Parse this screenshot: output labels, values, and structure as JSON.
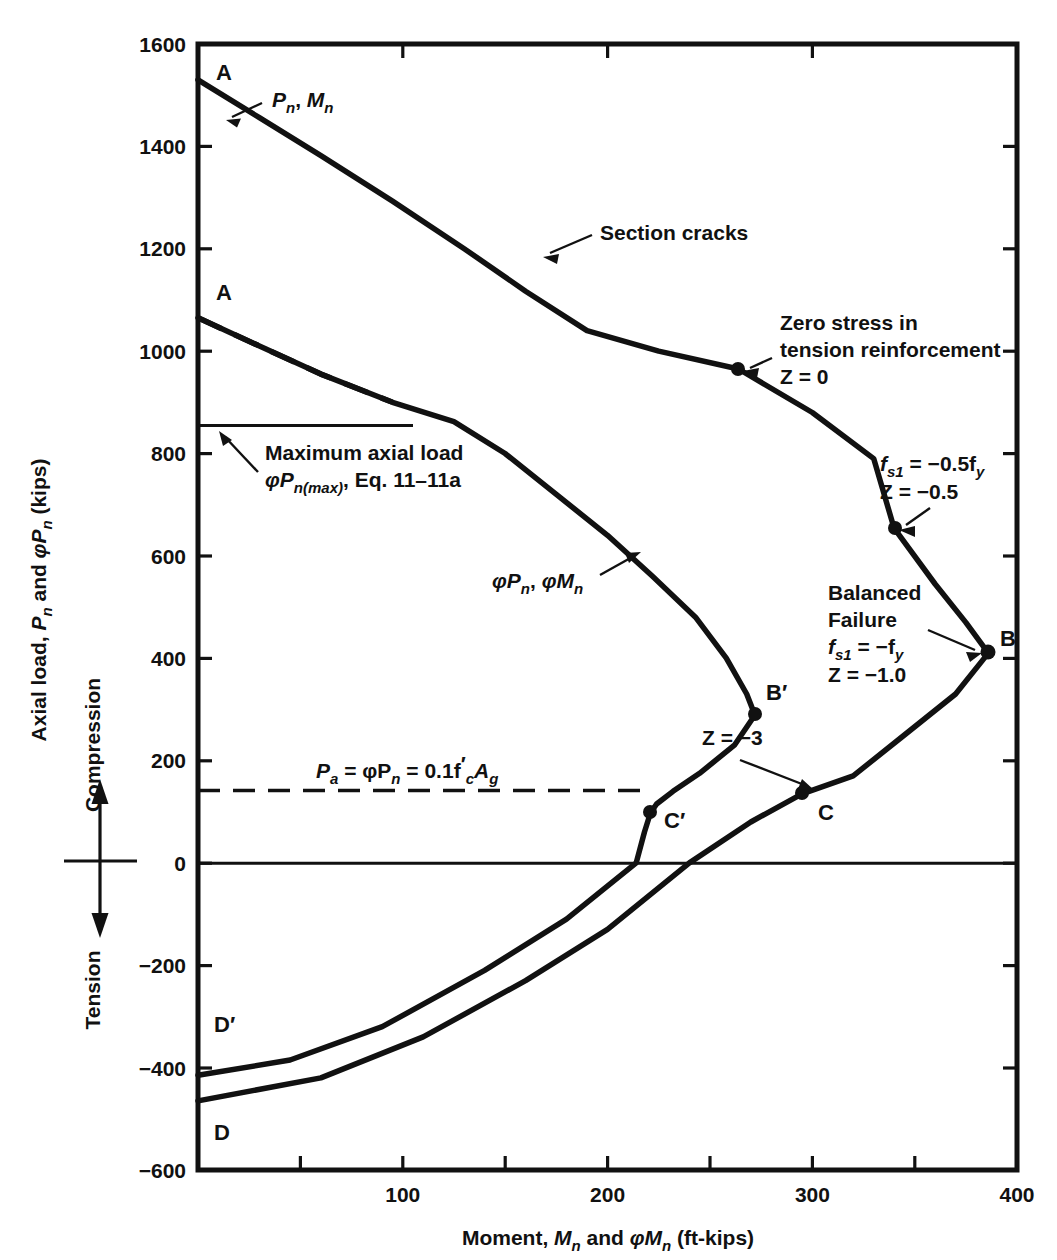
{
  "chart_data": {
    "type": "line",
    "title": "",
    "xlabel": "Moment, Mn and φMn (ft-kips)",
    "ylabel": "Axial load, Pn and φPn (kips)",
    "xlim": [
      0,
      400
    ],
    "ylim": [
      -600,
      1600
    ],
    "xticks": [
      100,
      200,
      300,
      400
    ],
    "xticklabels": [
      "100",
      "200",
      "300",
      "400"
    ],
    "xminorticks": [
      50,
      150,
      250,
      350
    ],
    "yticks": [
      1600,
      1400,
      1200,
      1000,
      800,
      600,
      400,
      200,
      0,
      -200,
      -400,
      -600
    ],
    "yticklabels": [
      "1600",
      "1400",
      "1200",
      "1000",
      "800",
      "600",
      "400",
      "200",
      "0",
      "−200",
      "−400",
      "−600"
    ],
    "grid": false,
    "legend": "none",
    "series": [
      {
        "name": "Pn, Mn (nominal strength interaction curve)",
        "style": "solid",
        "points": [
          [
            0,
            1530
          ],
          [
            30,
            1456
          ],
          [
            60,
            1382
          ],
          [
            95,
            1293
          ],
          [
            130,
            1200
          ],
          [
            160,
            1117
          ],
          [
            190,
            1040
          ],
          [
            225,
            1000
          ],
          [
            264,
            965
          ],
          [
            300,
            880
          ],
          [
            330,
            790
          ],
          [
            340,
            654
          ],
          [
            360,
            545
          ],
          [
            375,
            470
          ],
          [
            386,
            410
          ],
          [
            370,
            330
          ],
          [
            345,
            250
          ],
          [
            320,
            170
          ],
          [
            295,
            135
          ],
          [
            270,
            80
          ],
          [
            240,
            0
          ],
          [
            200,
            -130
          ],
          [
            160,
            -230
          ],
          [
            110,
            -340
          ],
          [
            60,
            -420
          ],
          [
            0,
            -465
          ]
        ]
      },
      {
        "name": "φPn, φMn (design strength interaction curve)",
        "style": "solid",
        "points": [
          [
            0,
            1065
          ],
          [
            30,
            1010
          ],
          [
            60,
            955
          ],
          [
            95,
            900
          ],
          [
            125,
            862
          ],
          [
            150,
            800
          ],
          [
            175,
            720
          ],
          [
            200,
            640
          ],
          [
            222,
            560
          ],
          [
            243,
            480
          ],
          [
            258,
            400
          ],
          [
            268,
            330
          ],
          [
            272,
            289
          ],
          [
            262,
            230
          ],
          [
            245,
            175
          ],
          [
            232,
            140
          ],
          [
            224,
            115
          ],
          [
            221,
            98
          ],
          [
            218,
            60
          ],
          [
            214,
            0
          ],
          [
            180,
            -110
          ],
          [
            140,
            -210
          ],
          [
            90,
            -320
          ],
          [
            45,
            -385
          ],
          [
            0,
            -415
          ]
        ]
      },
      {
        "name": "A to φPn curve dashed segment (cut off by max axial load)",
        "style": "dashed",
        "points": [
          [
            0,
            1065
          ],
          [
            30,
            1010
          ],
          [
            60,
            955
          ],
          [
            95,
            900
          ]
        ]
      },
      {
        "name": "Maximum axial load φPn(max) cutoff",
        "style": "solid-thin-horizontal",
        "points": [
          [
            0,
            855
          ],
          [
            105,
            855
          ]
        ]
      },
      {
        "name": "Pa = φPn = 0.1f'cAg",
        "style": "dashed-thin-horizontal",
        "points": [
          [
            0,
            142
          ],
          [
            222,
            142
          ]
        ]
      },
      {
        "name": "zero axis",
        "style": "solid-thin-horizontal",
        "points": [
          [
            0,
            0
          ],
          [
            400,
            0
          ]
        ]
      }
    ],
    "marked_points": [
      {
        "label": "A",
        "x": 0,
        "y": 1530,
        "series": "Pn, Mn",
        "label_dx": 18,
        "label_dy": 34
      },
      {
        "label": "A",
        "x": 0,
        "y": 1065,
        "series": "φPn, φMn",
        "label_dx": 18,
        "label_dy": -16
      },
      {
        "label": "B",
        "x": 386,
        "y": 410,
        "series": "Pn, Mn",
        "label_dx": 22,
        "label_dy": -10,
        "dot": true
      },
      {
        "label": "B′",
        "x": 272,
        "y": 289,
        "series": "φPn, φMn",
        "label_dx": 20,
        "label_dy": -12,
        "dot": true
      },
      {
        "label": "C",
        "x": 295,
        "y": 135,
        "series": "Pn, Mn",
        "label_dx": 22,
        "label_dy": 24,
        "dot": true
      },
      {
        "label": "C′",
        "x": 221,
        "y": 98,
        "series": "φPn, φMn",
        "label_dx": 20,
        "label_dy": 10,
        "dot": true
      },
      {
        "label": "D",
        "x": 0,
        "y": -465,
        "series": "Pn, Mn",
        "label_dx": 16,
        "label_dy": 32
      },
      {
        "label": "D′",
        "x": 0,
        "y": -415,
        "series": "φPn, φMn",
        "label_dx": 16,
        "label_dy": -14
      },
      {
        "label": "Z = 0",
        "x": 264,
        "y": 965,
        "series": "Pn, Mn",
        "dot": true
      },
      {
        "label": "Z = -0.5",
        "x": 340,
        "y": 654,
        "series": "Pn, Mn",
        "dot": true
      }
    ]
  },
  "axes": {
    "y_title_main": "Axial load, ",
    "y_title_pn": "P",
    "y_title_pn_sub": "n",
    "y_title_and": " and ",
    "y_title_phi": "φP",
    "y_title_phi_sub": "n",
    "y_title_units": " (kips)",
    "y_title_plain": "Axial load, Pn and φPn (kips)",
    "compression_label": "Compression",
    "tension_label": "Tension",
    "x_title_plain": "Moment, Mn and φMn (ft-kips)",
    "x_title_main": "Moment, ",
    "x_title_mn": "M",
    "x_title_mn_sub": "n",
    "x_title_and": " and ",
    "x_title_phi": "φM",
    "x_title_phi_sub": "n",
    "x_title_units": " (ft-kips)",
    "ytick_labels": [
      "1600",
      "1400",
      "1200",
      "1000",
      "800",
      "600",
      "400",
      "200",
      "0",
      "−200",
      "−400",
      "−600"
    ],
    "xtick_labels": [
      "100",
      "200",
      "300",
      "400"
    ]
  },
  "annotations": {
    "pn_mn_curve": {
      "text": "Pn, Mn",
      "parts": [
        "P",
        "n",
        ", ",
        "M",
        "n"
      ]
    },
    "phi_curve": {
      "text": "φPn, φMn",
      "parts": [
        "φP",
        "n",
        ", ",
        "φM",
        "n"
      ]
    },
    "section_cracks": "Section cracks",
    "zero_stress_line1": "Zero stress in",
    "zero_stress_line2": "tension reinforcement",
    "zero_stress_line3": "Z = 0",
    "fs_half_line1_a": "f",
    "fs_half_line1_sub": "s1",
    "fs_half_line1_b": " =  −0.5f",
    "fs_half_line1_sub2": "y",
    "fs_half_line2": "Z =  −0.5",
    "balanced_line1": "Balanced",
    "balanced_line2": "Failure",
    "balanced_line3_a": "f",
    "balanced_line3_sub": "s1",
    "balanced_line3_b": " =  −f",
    "balanced_line3_sub2": "y",
    "balanced_line4": "Z =  −1.0",
    "z_minus3": "Z = −3",
    "max_axial_line1": "Maximum axial load",
    "max_axial_line2_a": "φP",
    "max_axial_line2_sub": "n(max)",
    "max_axial_line2_b": ", Eq. 11–11a",
    "pa_line_a": "P",
    "pa_line_sub": "a",
    "pa_line_b": " = φP",
    "pa_line_sub2": "n",
    "pa_line_c": " = 0.1f",
    "pa_line_sub3": "c",
    "pa_line_prime": "′",
    "pa_line_d": "A",
    "pa_line_sub4": "g",
    "pa_plain": "Pa = φPn = 0.1f'cAg"
  },
  "colors": {
    "line": "#111111",
    "background": "#ffffff",
    "text": "#111111"
  }
}
